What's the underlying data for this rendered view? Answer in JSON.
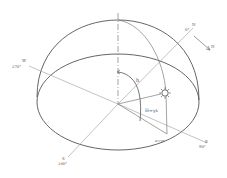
{
  "diagram": {
    "type": "celestial-hemisphere-sun-position",
    "colors": {
      "stroke": "#555555",
      "light_stroke": "#9a9a9a",
      "background": "#ffffff"
    },
    "labels": {
      "west": "W",
      "west_sub": "270°",
      "north": "N",
      "north_sub": "0°",
      "north_arrow": "N",
      "east": "E",
      "east_sub": "90°",
      "south": "S",
      "south_sub": "180°",
      "altitude": "h",
      "azimuth": "H=γs",
      "azimuth_point": "a=γs"
    },
    "symbols": {
      "sun": "sun-icon",
      "north_arrow": "arrow-icon"
    }
  }
}
